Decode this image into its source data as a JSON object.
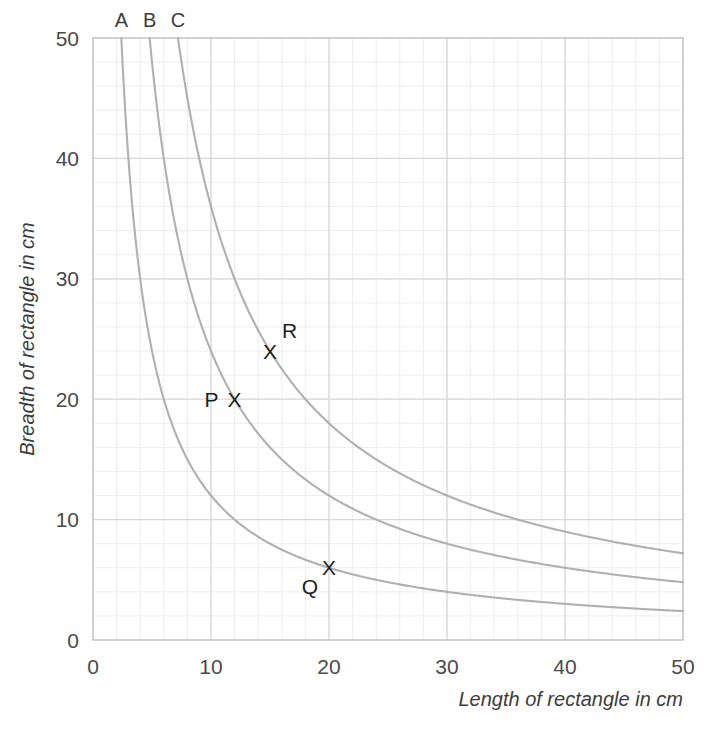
{
  "chart_data": {
    "type": "line",
    "title": "",
    "subtitle": "",
    "xlabel": "Length of rectangle in cm",
    "ylabel": "Breadth of rectangle in cm",
    "xlim": [
      0,
      50
    ],
    "ylim": [
      0,
      50
    ],
    "xticks": [
      "0",
      "10",
      "20",
      "30",
      "40",
      "50"
    ],
    "xtick_values": [
      0,
      10,
      20,
      30,
      40,
      50
    ],
    "yticks": [
      "0",
      "10",
      "20",
      "30",
      "40",
      "50"
    ],
    "ytick_values": [
      0,
      10,
      20,
      30,
      40,
      50
    ],
    "grid": "major and minor",
    "grid_major_step": 10,
    "grid_minor_step": 2,
    "legend_position": "curve-end labels at top of plot",
    "series": [
      {
        "name": "A",
        "label": "A",
        "relation": "x*y = 120",
        "constant": 120,
        "label_x": 2.4,
        "label_y": 50,
        "points": [
          {
            "x": 2.4,
            "y": 50.0
          },
          {
            "x": 3.0,
            "y": 40.0
          },
          {
            "x": 4.0,
            "y": 30.0
          },
          {
            "x": 5.0,
            "y": 24.0
          },
          {
            "x": 6.0,
            "y": 20.0
          },
          {
            "x": 8.0,
            "y": 15.0
          },
          {
            "x": 10.0,
            "y": 12.0
          },
          {
            "x": 12.0,
            "y": 10.0
          },
          {
            "x": 15.0,
            "y": 8.0
          },
          {
            "x": 20.0,
            "y": 6.0
          },
          {
            "x": 24.0,
            "y": 5.0
          },
          {
            "x": 30.0,
            "y": 4.0
          },
          {
            "x": 40.0,
            "y": 3.0
          },
          {
            "x": 50.0,
            "y": 2.4
          }
        ]
      },
      {
        "name": "B",
        "label": "B",
        "relation": "x*y = 240",
        "constant": 240,
        "label_x": 4.8,
        "label_y": 50,
        "points": [
          {
            "x": 4.8,
            "y": 50.0
          },
          {
            "x": 6.0,
            "y": 40.0
          },
          {
            "x": 8.0,
            "y": 30.0
          },
          {
            "x": 10.0,
            "y": 24.0
          },
          {
            "x": 12.0,
            "y": 20.0
          },
          {
            "x": 16.0,
            "y": 15.0
          },
          {
            "x": 20.0,
            "y": 12.0
          },
          {
            "x": 24.0,
            "y": 10.0
          },
          {
            "x": 30.0,
            "y": 8.0
          },
          {
            "x": 40.0,
            "y": 6.0
          },
          {
            "x": 48.0,
            "y": 5.0
          },
          {
            "x": 50.0,
            "y": 4.8
          }
        ]
      },
      {
        "name": "C",
        "label": "C",
        "relation": "x*y = 360",
        "constant": 360,
        "label_x": 7.2,
        "label_y": 50,
        "points": [
          {
            "x": 7.2,
            "y": 50.0
          },
          {
            "x": 9.0,
            "y": 40.0
          },
          {
            "x": 12.0,
            "y": 30.0
          },
          {
            "x": 15.0,
            "y": 24.0
          },
          {
            "x": 18.0,
            "y": 20.0
          },
          {
            "x": 24.0,
            "y": 15.0
          },
          {
            "x": 30.0,
            "y": 12.0
          },
          {
            "x": 36.0,
            "y": 10.0
          },
          {
            "x": 45.0,
            "y": 8.0
          },
          {
            "x": 50.0,
            "y": 7.2
          }
        ]
      }
    ],
    "annotations": [
      {
        "label": "P",
        "x": 12,
        "y": 20,
        "marker": "X",
        "on_curve": "B",
        "label_position": "left"
      },
      {
        "label": "Q",
        "x": 20,
        "y": 6,
        "marker": "X",
        "on_curve": "A",
        "label_position": "below-left"
      },
      {
        "label": "R",
        "x": 15,
        "y": 24,
        "marker": "X",
        "on_curve": "C",
        "label_position": "above-right"
      }
    ],
    "colors": {
      "curve": "#b0b0b0",
      "grid_major": "#d8d8d8",
      "grid_minor": "#ededed",
      "frame": "#c8c8c8",
      "text": "#3c3c3c",
      "marker": "#1f1f1f",
      "background": "#ffffff"
    }
  }
}
